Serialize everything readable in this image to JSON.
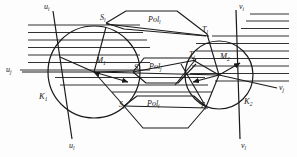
{
  "figure": {
    "type": "geometry-diagram",
    "title": "",
    "background_color": "#fdfdfd",
    "stroke_color": "#1a1a1a",
    "width": 297,
    "height": 157
  },
  "circles": [
    {
      "name": "K1",
      "label": "K",
      "sub": "1",
      "cx": 94,
      "cy": 72,
      "r": 46
    },
    {
      "name": "K2",
      "label": "K",
      "sub": "2",
      "cx": 219,
      "cy": 75,
      "r": 34
    }
  ],
  "centers": [
    {
      "name": "M1",
      "label": "M",
      "sub": "1",
      "x": 94,
      "y": 72
    },
    {
      "name": "M2",
      "label": "M",
      "sub": "2",
      "x": 219,
      "y": 75
    }
  ],
  "labels": {
    "u_i": {
      "text": "u",
      "sub": "i",
      "x": 44,
      "y": 4
    },
    "u_j": {
      "text": "u",
      "sub": "j",
      "x": 7,
      "y": 66
    },
    "u_l": {
      "text": "u",
      "sub": "l",
      "x": 70,
      "y": 144
    },
    "v_i": {
      "text": "v",
      "sub": "i",
      "x": 240,
      "y": 4
    },
    "v_j": {
      "text": "v",
      "sub": "j",
      "x": 278,
      "y": 88
    },
    "v_l": {
      "text": "v",
      "sub": "l",
      "x": 242,
      "y": 144
    },
    "S_l": {
      "text": "S",
      "sub": "l",
      "x": 101,
      "y": 17
    },
    "S_j": {
      "text": "S",
      "sub": "j",
      "x": 134,
      "y": 67
    },
    "S_i": {
      "text": "S",
      "sub": "i",
      "x": 120,
      "y": 104
    },
    "T_l": {
      "text": "T",
      "sub": "l",
      "x": 202,
      "y": 29
    },
    "T_j": {
      "text": "T",
      "sub": "j",
      "x": 190,
      "y": 55
    },
    "T_i": {
      "text": "T",
      "sub": "i",
      "x": 200,
      "y": 105
    },
    "M_1": {
      "text": "M",
      "sub": "1",
      "x": 95,
      "y": 60
    },
    "M_2": {
      "text": "M",
      "sub": "2",
      "x": 220,
      "y": 56
    },
    "K_1": {
      "text": "K",
      "sub": "1",
      "x": 40,
      "y": 95
    },
    "K_2": {
      "text": "K",
      "sub": "2",
      "x": 245,
      "y": 100
    },
    "Pol_l": {
      "text": "Pol",
      "sub": "l",
      "x": 150,
      "y": 19
    },
    "Pol_j": {
      "text": "Pol",
      "sub": "j",
      "x": 150,
      "y": 66
    },
    "Pol_i": {
      "text": "Pol",
      "sub": "i",
      "x": 148,
      "y": 103
    }
  },
  "hatching": {
    "left": {
      "x_start": 28,
      "x_end": 140,
      "y_values": [
        25,
        32.5,
        40,
        47.5,
        55,
        62.5,
        70,
        77.5
      ]
    },
    "right": {
      "x_start": 196,
      "x_end": 289,
      "y_values": [
        21,
        28.5,
        36,
        43.5,
        51,
        58.5,
        66,
        73.5,
        81
      ]
    }
  },
  "rays": {
    "u_i_ray": {
      "x1": 52,
      "y1": 11,
      "x2": 94,
      "y2": 72
    },
    "u_l_ray": {
      "x1": 94,
      "y1": 72,
      "x2": 72,
      "y2": 139
    },
    "u_j_ray": {
      "x1": 22,
      "y1": 72,
      "x2": 94,
      "y2": 72
    },
    "v_i_ray": {
      "x1": 235,
      "y1": 10,
      "x2": 219,
      "y2": 75
    },
    "v_l_ray": {
      "x1": 219,
      "y1": 75,
      "x2": 240,
      "y2": 139
    },
    "v_j_ray": {
      "x1": 219,
      "y1": 75,
      "x2": 276,
      "y2": 87
    }
  },
  "polygons": {
    "Pol_l": [
      [
        108,
        22
      ],
      [
        124,
        11
      ],
      [
        176,
        11
      ],
      [
        206,
        33
      ],
      [
        122,
        37
      ]
    ],
    "Pol_j": [
      [
        140,
        70
      ],
      [
        148,
        57
      ],
      [
        178,
        57
      ],
      [
        196,
        58
      ],
      [
        188,
        78
      ],
      [
        150,
        82
      ]
    ],
    "Pol_i": [
      [
        124,
        108
      ],
      [
        137,
        95
      ],
      [
        196,
        95
      ],
      [
        206,
        108
      ],
      [
        188,
        128
      ],
      [
        143,
        128
      ]
    ]
  },
  "tangent_lines": [
    {
      "from": "S_l",
      "to": "T_l"
    },
    {
      "from": "S_j",
      "to": "T_j"
    },
    {
      "from": "S_i",
      "to": "T_i"
    },
    {
      "from": "M_1",
      "to": "S_l"
    },
    {
      "from": "M_1",
      "to": "S_j"
    },
    {
      "from": "M_1",
      "to": "S_i"
    },
    {
      "from": "M_2",
      "to": "T_l"
    },
    {
      "from": "M_2",
      "to": "T_j"
    },
    {
      "from": "M_2",
      "to": "T_i"
    }
  ]
}
